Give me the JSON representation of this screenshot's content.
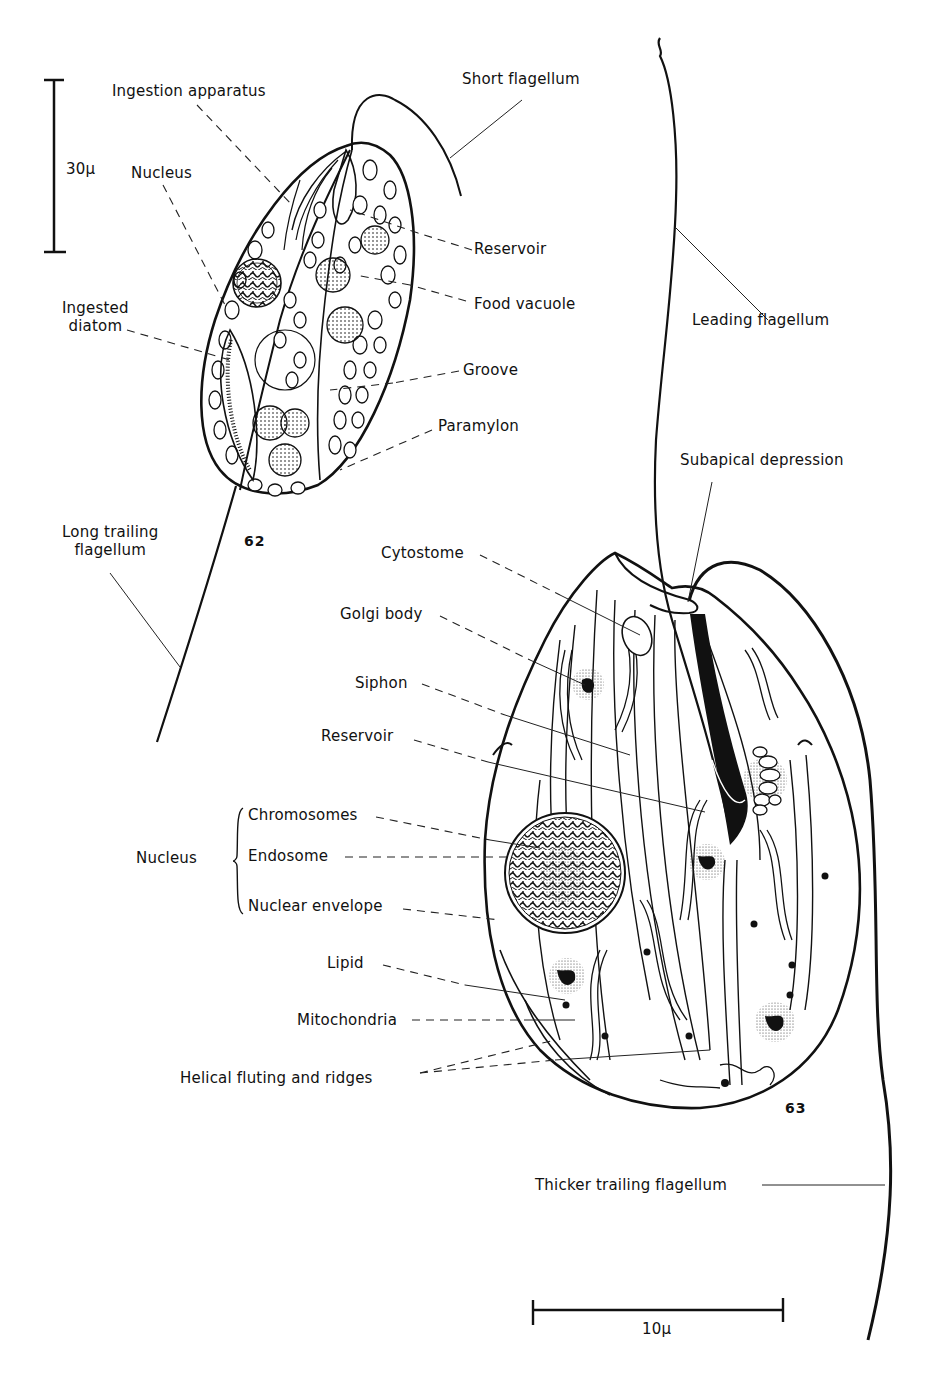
{
  "figure_62": {
    "number": "62",
    "scale_bar": "30μ",
    "labels": {
      "ingestion_apparatus": "Ingestion apparatus",
      "nucleus": "Nucleus",
      "short_flagellum": "Short flagellum",
      "reservoir": "Reservoir",
      "food_vacuole": "Food vacuole",
      "ingested_diatom": "Ingested\ndiatom",
      "groove": "Groove",
      "paramylon": "Paramylon",
      "long_trailing_flagellum": "Long trailing\nflagellum"
    }
  },
  "figure_63": {
    "number": "63",
    "scale_bar": "10μ",
    "labels": {
      "leading_flagellum": "Leading flagellum",
      "subapical_depression": "Subapical depression",
      "cytostome": "Cytostome",
      "golgi_body": "Golgi body",
      "siphon": "Siphon",
      "reservoir": "Reservoir",
      "nucleus_group": "Nucleus",
      "chromosomes": "Chromosomes",
      "endosome": "Endosome",
      "nuclear_envelope": "Nuclear envelope",
      "lipid": "Lipid",
      "mitochondria": "Mitochondria",
      "helical_fluting": "Helical fluting and ridges",
      "thicker_trailing_flagellum": "Thicker trailing flagellum"
    }
  },
  "colors": {
    "ink": "#111111",
    "paper": "#ffffff"
  }
}
